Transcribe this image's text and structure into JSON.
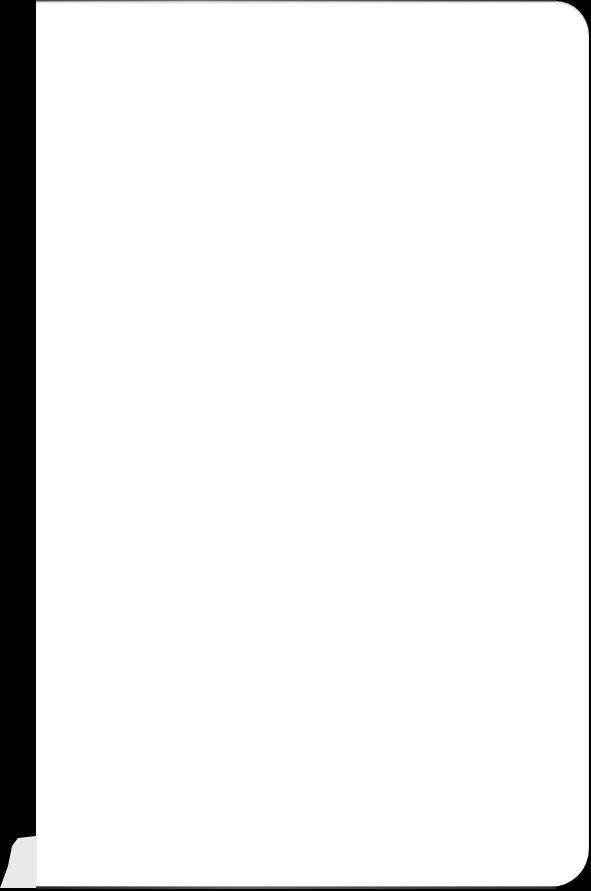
{
  "scene": {
    "description": "Blank white paper page on a black background",
    "colors": {
      "background": "#000000",
      "page": "#ffffff",
      "corner_flap": "#e9e9e9"
    }
  }
}
